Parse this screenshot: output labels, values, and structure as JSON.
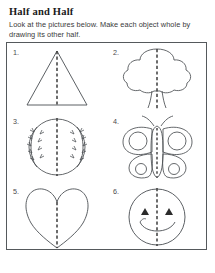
{
  "worksheet": {
    "title": "Half and Half",
    "instructions": "Look at the pictures below. Make each object whole by drawing its other half.",
    "footer": "",
    "ink_color": "#4a4e52",
    "fold_line_color": "#3c3c3c",
    "border_color": "#55595c",
    "grid": {
      "columns": 2,
      "rows": 3
    },
    "items": [
      {
        "number": "1.",
        "shape": "triangle",
        "icon": "triangle-icon",
        "fold": "vertical"
      },
      {
        "number": "2.",
        "shape": "tree",
        "icon": "tree-icon",
        "fold": "vertical"
      },
      {
        "number": "3.",
        "shape": "baseball",
        "icon": "baseball-icon",
        "fold": "vertical"
      },
      {
        "number": "4.",
        "shape": "butterfly",
        "icon": "butterfly-icon",
        "fold": "vertical"
      },
      {
        "number": "5.",
        "shape": "heart",
        "icon": "heart-icon",
        "fold": "vertical"
      },
      {
        "number": "6.",
        "shape": "smiley",
        "icon": "smiley-face-icon",
        "fold": "vertical"
      }
    ]
  }
}
